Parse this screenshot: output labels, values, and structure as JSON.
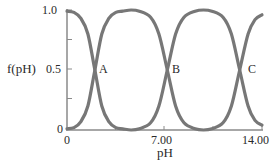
{
  "chart_data": {
    "type": "line",
    "title": "",
    "xlabel": "pH",
    "ylabel": "f(pH)",
    "xlim": [
      0,
      14
    ],
    "ylim": [
      0,
      1.0
    ],
    "x_ticks": [
      0,
      3.5,
      7.0,
      10.5,
      14.0
    ],
    "x_tick_labels": [
      "0",
      "",
      "7.00",
      "",
      "14.00"
    ],
    "y_ticks": [
      0,
      0.25,
      0.5,
      0.75,
      1.0
    ],
    "y_tick_labels": [
      "0",
      "",
      "0.5",
      "",
      "1.0"
    ],
    "grid": false,
    "legend": null,
    "line_color": "#777777",
    "crossing_points": [
      {
        "label": "A",
        "x": 2.0,
        "y": 0.5
      },
      {
        "label": "B",
        "x": 7.2,
        "y": 0.5
      },
      {
        "label": "C",
        "x": 12.4,
        "y": 0.5
      }
    ],
    "series": [
      {
        "name": "curve-1",
        "x": [
          0,
          0.5,
          1.0,
          1.5,
          2.0,
          2.5,
          3.0,
          3.5,
          4.0,
          4.6,
          5.2,
          6.0,
          6.6,
          7.2,
          7.8,
          8.4,
          9.2,
          9.8,
          10.4,
          11.2,
          11.8,
          12.4,
          13.0,
          13.5,
          14.0
        ],
        "values": [
          0.99,
          0.98,
          0.93,
          0.8,
          0.5,
          0.2,
          0.07,
          0.02,
          0.01,
          0.0,
          0.01,
          0.06,
          0.2,
          0.5,
          0.8,
          0.94,
          0.99,
          1.0,
          0.99,
          0.94,
          0.8,
          0.5,
          0.2,
          0.08,
          0.04
        ]
      },
      {
        "name": "curve-2",
        "x": [
          0,
          0.5,
          1.0,
          1.5,
          2.0,
          2.5,
          3.0,
          3.5,
          4.0,
          4.6,
          5.2,
          6.0,
          6.6,
          7.2,
          7.8,
          8.4,
          9.2,
          9.8,
          10.4,
          11.2,
          11.8,
          12.4,
          13.0,
          13.5,
          14.0
        ],
        "values": [
          0.01,
          0.02,
          0.07,
          0.2,
          0.5,
          0.8,
          0.93,
          0.98,
          0.99,
          1.0,
          0.99,
          0.94,
          0.8,
          0.5,
          0.2,
          0.06,
          0.01,
          0.0,
          0.01,
          0.06,
          0.2,
          0.5,
          0.8,
          0.92,
          0.96
        ]
      }
    ],
    "annotations": [
      "A",
      "B",
      "C"
    ]
  },
  "labels": {
    "ylabel": "f(pH)",
    "xlabel": "pH",
    "y_1_0": "1.0",
    "y_0_5": "0.5",
    "y_0": "0",
    "x_0": "0",
    "x_7": "7.00",
    "x_14": "14.00",
    "point_a": "A",
    "point_b": "B",
    "point_c": "C"
  }
}
